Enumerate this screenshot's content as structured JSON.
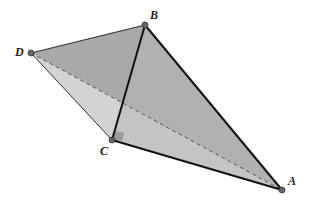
{
  "diagram": {
    "type": "tetrahedron",
    "vertices": {
      "A": {
        "label": "A",
        "x": 282,
        "y": 190
      },
      "B": {
        "label": "B",
        "x": 145,
        "y": 25
      },
      "C": {
        "label": "C",
        "x": 112,
        "y": 140
      },
      "D": {
        "label": "D",
        "x": 31,
        "y": 53
      }
    },
    "faces": [
      {
        "name": "DBA",
        "fill": "#a9a9a9"
      },
      {
        "name": "BCA",
        "fill": "#b8b8b8"
      },
      {
        "name": "DCA",
        "fill": "#d3d3d3"
      }
    ],
    "edges": [
      {
        "from": "D",
        "to": "B",
        "style": "solid"
      },
      {
        "from": "B",
        "to": "C",
        "style": "solid"
      },
      {
        "from": "B",
        "to": "A",
        "style": "solid"
      },
      {
        "from": "C",
        "to": "A",
        "style": "solid"
      },
      {
        "from": "D",
        "to": "C",
        "style": "solid-thin"
      },
      {
        "from": "D",
        "to": "A",
        "style": "dashed"
      }
    ],
    "right_angle_marker": {
      "at": "C",
      "fill": "#9a9a9a"
    }
  }
}
